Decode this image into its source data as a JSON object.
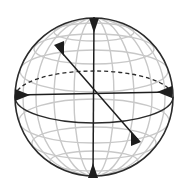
{
  "diagram": {
    "type": "sphere-with-axes",
    "colors": {
      "background": "#ffffff",
      "outline": "#2b2b2b",
      "grid": "#c8c8c8",
      "axis": "#1e1e1e"
    },
    "sphere": {
      "cx": 94,
      "cy": 97,
      "r": 79
    },
    "equator": {
      "rx": 79,
      "ry": 26,
      "back_dashed": true
    },
    "axes": [
      {
        "name": "vertical-axis",
        "x1": 94,
        "y1": 17,
        "x2": 93,
        "y2": 178
      },
      {
        "name": "horizontal-axis",
        "x1": 15,
        "y1": 95,
        "x2": 171,
        "y2": 92
      },
      {
        "name": "diagonal-axis",
        "x1": 57,
        "y1": 47,
        "x2": 138,
        "y2": 140
      }
    ],
    "labels": []
  }
}
